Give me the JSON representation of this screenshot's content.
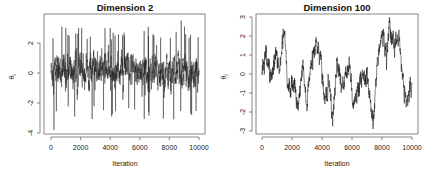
{
  "chart_data": [
    {
      "type": "line",
      "title": "Dimension 2",
      "xlabel": "Iteration",
      "ylabel": "θ_i",
      "xlim": [
        0,
        10000
      ],
      "ylim": [
        -4,
        3.8
      ],
      "xticks": [
        0,
        2000,
        4000,
        6000,
        8000,
        10000
      ],
      "yticks": [
        -4,
        -2,
        0,
        2
      ],
      "grid": false,
      "legend": null,
      "description": "Fast-mixing trace plot; dense noise band centered near 0",
      "series": [
        {
          "name": "theta_2",
          "n_points": 10000,
          "mean": 0.1,
          "typical_range": [
            -2,
            2
          ],
          "max": 3.5,
          "min": -3.8,
          "keypoints_x": [
            0,
            200,
            1000,
            1600,
            4000,
            4100,
            8800,
            9500,
            10000
          ],
          "keypoints_y": [
            0.2,
            -3.8,
            3.0,
            -2.9,
            3.0,
            -2.9,
            3.5,
            -2.8,
            0.3
          ]
        }
      ]
    },
    {
      "type": "line",
      "title": "Dimension 100",
      "xlabel": "Iteration",
      "ylabel": "θ_i",
      "xlim": [
        0,
        10000
      ],
      "ylim": [
        -3,
        3
      ],
      "xticks": [
        0,
        2000,
        4000,
        6000,
        8000,
        10000
      ],
      "yticks": [
        -3,
        -2,
        -1,
        0,
        1,
        2,
        3
      ],
      "grid": false,
      "legend": null,
      "description": "Slow-mixing trace plot; autocorrelated random walk",
      "series": [
        {
          "name": "theta_100",
          "n_points": 10000,
          "keypoints_x": [
            0,
            300,
            600,
            900,
            1200,
            1500,
            1700,
            2000,
            2400,
            2700,
            3000,
            3300,
            3600,
            3900,
            4200,
            4500,
            4700,
            5000,
            5400,
            5800,
            6100,
            6500,
            7000,
            7400,
            7700,
            8000,
            8300,
            8500,
            8800,
            9100,
            9400,
            9700,
            10000
          ],
          "keypoints_y": [
            0.2,
            1.3,
            -0.2,
            1.0,
            0.2,
            2.4,
            -0.8,
            -0.3,
            -1.5,
            0.2,
            -1.6,
            0.5,
            1.5,
            1.0,
            -1.5,
            -0.4,
            -2.5,
            0.5,
            -0.8,
            0.7,
            -1.9,
            -0.5,
            -0.2,
            -2.8,
            0.8,
            2.0,
            1.2,
            2.7,
            1.3,
            2.4,
            -0.4,
            -1.6,
            -0.3
          ]
        }
      ]
    }
  ],
  "panels": [
    {
      "title": "Dimension 2",
      "xlabel": "Iteration",
      "ylabel": "θ",
      "ylabel_sub": "i",
      "xtick_labels": [
        "0",
        "2000",
        "4000",
        "6000",
        "8000",
        "10000"
      ],
      "ytick_labels": [
        "2",
        "0",
        "-2",
        "-4"
      ]
    },
    {
      "title": "Dimension 100",
      "xlabel": "Iteration",
      "ylabel": "θ",
      "ylabel_sub": "i",
      "xtick_labels": [
        "0",
        "2000",
        "4000",
        "6000",
        "8000",
        "10000"
      ],
      "ytick_labels": [
        "3",
        "2",
        "1",
        "0",
        "-1",
        "-2",
        "-3"
      ]
    }
  ],
  "colors": {
    "trace": "#1a1a1a",
    "axis": "#555555",
    "background": "#ffffff"
  }
}
